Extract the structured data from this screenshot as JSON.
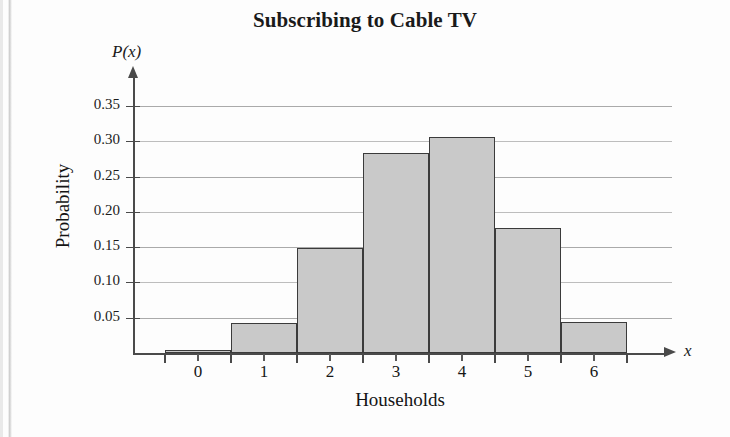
{
  "chart_data": {
    "type": "bar",
    "title": "Subscribing to Cable TV",
    "xlabel": "Households",
    "ylabel": "Probability",
    "x_axis_variable": "x",
    "y_axis_variable": "P(x)",
    "categories": [
      "0",
      "1",
      "2",
      "3",
      "4",
      "5",
      "6"
    ],
    "values": [
      0.005,
      0.042,
      0.149,
      0.283,
      0.306,
      0.177,
      0.044
    ],
    "ylim": [
      0,
      0.375
    ],
    "xlim": [
      -0.5,
      6.5
    ],
    "ytick_labels": [
      "0.05",
      "0.10",
      "0.15",
      "0.20",
      "0.25",
      "0.30",
      "0.35"
    ],
    "ytick_values": [
      0.05,
      0.1,
      0.15,
      0.2,
      0.25,
      0.3,
      0.35
    ],
    "grid": "horizontal",
    "legend": "none",
    "bar_fill_color": "#c9c9c9",
    "bar_border_color": "#3b3b3b",
    "gridline_color": "#aaaaaa",
    "axis_color": "#4a4a4a"
  }
}
